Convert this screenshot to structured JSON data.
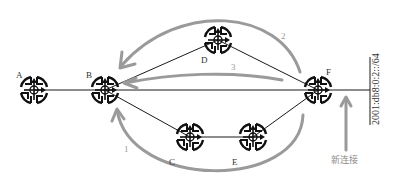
{
  "diagram": {
    "title": "",
    "colors": {
      "link": "#1a1a1a",
      "route_arrow": "#9a9a9a",
      "router_icon": "#111111",
      "background": "#ffffff"
    },
    "routers": [
      {
        "id": "A",
        "label": "A",
        "icon": "router-icon"
      },
      {
        "id": "B",
        "label": "B",
        "icon": "router-icon"
      },
      {
        "id": "C",
        "label": "C",
        "icon": "router-icon"
      },
      {
        "id": "D",
        "label": "D",
        "icon": "router-icon"
      },
      {
        "id": "E",
        "label": "E",
        "icon": "router-icon"
      },
      {
        "id": "F",
        "label": "F",
        "icon": "router-icon"
      }
    ],
    "links": [
      {
        "from": "A",
        "to": "B"
      },
      {
        "from": "B",
        "to": "D"
      },
      {
        "from": "B",
        "to": "F"
      },
      {
        "from": "B",
        "to": "C"
      },
      {
        "from": "C",
        "to": "E"
      },
      {
        "from": "D",
        "to": "F"
      },
      {
        "from": "E",
        "to": "F"
      },
      {
        "from": "F",
        "to": "network"
      }
    ],
    "routes": [
      {
        "id": "1",
        "label": "1",
        "path": "F → E → C → B"
      },
      {
        "id": "2",
        "label": "2",
        "path": "F → D → B"
      },
      {
        "id": "3",
        "label": "3",
        "path": "F → B"
      }
    ],
    "network": {
      "prefix": "2001:db8:0:2::/64",
      "new_connection_label": "新连接"
    }
  }
}
